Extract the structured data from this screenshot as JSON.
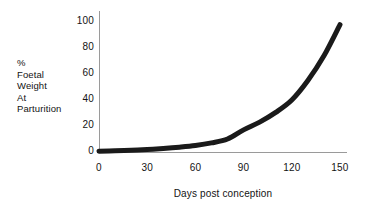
{
  "chart_data": {
    "type": "line",
    "title": "",
    "xlabel": "Days post conception",
    "ylabel": "% Foetal Weight At Parturition",
    "ylabel_lines": [
      "%",
      "Foetal",
      "Weight",
      "At",
      "Parturition"
    ],
    "xlim": [
      0,
      150
    ],
    "ylim": [
      0,
      100
    ],
    "xticks": [
      0,
      30,
      60,
      90,
      120,
      150
    ],
    "yticks": [
      0,
      20,
      40,
      60,
      80,
      100
    ],
    "xtick_labels": [
      "0",
      "30",
      "60",
      "90",
      "120",
      "150"
    ],
    "ytick_labels": [
      "0",
      "20",
      "40",
      "60",
      "80",
      "100"
    ],
    "grid": false,
    "legend": false,
    "series": [
      {
        "name": "Foetal weight growth",
        "color": "#1a1a1a",
        "line_width_px": 5,
        "x": [
          0,
          10,
          20,
          30,
          40,
          50,
          60,
          70,
          80,
          90,
          100,
          110,
          120,
          130,
          140,
          150
        ],
        "values": [
          0.6,
          0.9,
          1.3,
          1.9,
          2.7,
          3.7,
          5.0,
          7.0,
          10.0,
          17.0,
          23.0,
          30.5,
          40.0,
          55.0,
          74.0,
          98.0
        ]
      }
    ]
  },
  "axis": {
    "line_color": "#9a9a9a",
    "text_color": "#131313"
  },
  "background_color": "#ffffff"
}
